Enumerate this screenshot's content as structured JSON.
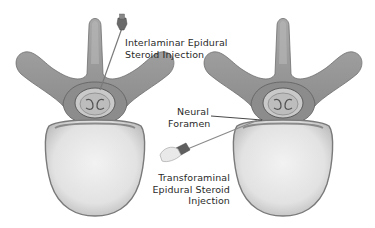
{
  "diagram": {
    "colors": {
      "background": "#ffffff",
      "bone_gray": "#9a9a9a",
      "bone_dark": "#6e6e6e",
      "body_light": "#e8e8e8",
      "text": "#2a2a2a"
    },
    "panels": [
      {
        "id": "left",
        "depicts": "vertebra-top-view",
        "needle": "interlaminar-needle"
      },
      {
        "id": "right",
        "depicts": "vertebra-top-view",
        "needle": "transforaminal-needle"
      }
    ],
    "labels": {
      "interlaminar": {
        "line1": "Interlaminar Epidural",
        "line2": "Steroid Injection"
      },
      "neural_foramen": {
        "line1": "Neural",
        "line2": "Foramen"
      },
      "transforaminal": {
        "line1": "Transforaminal",
        "line2": "Epidural Steroid",
        "line3": "Injection"
      }
    }
  }
}
